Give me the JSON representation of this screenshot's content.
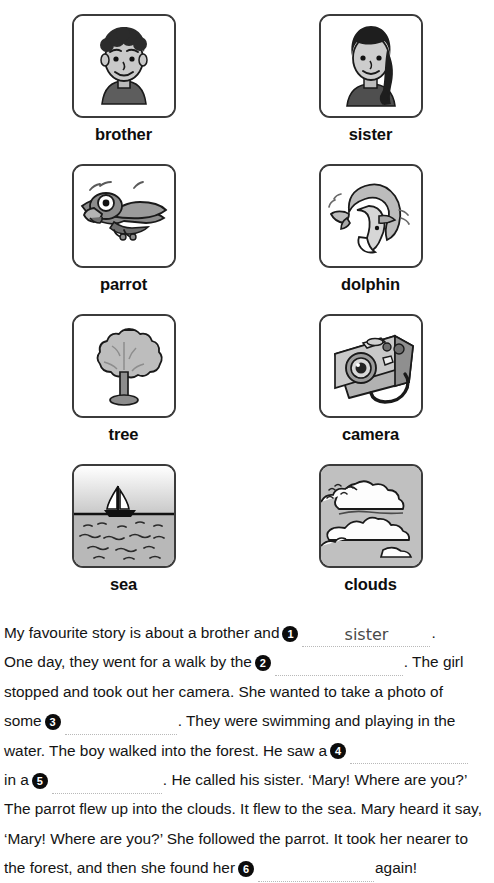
{
  "cards": [
    {
      "label": "brother",
      "icon": "brother-portrait-icon"
    },
    {
      "label": "sister",
      "icon": "sister-portrait-icon"
    },
    {
      "label": "parrot",
      "icon": "parrot-icon"
    },
    {
      "label": "dolphin",
      "icon": "dolphin-icon"
    },
    {
      "label": "tree",
      "icon": "tree-icon"
    },
    {
      "label": "camera",
      "icon": "camera-icon"
    },
    {
      "label": "sea",
      "icon": "sea-sailboat-icon"
    },
    {
      "label": "clouds",
      "icon": "clouds-icon"
    }
  ],
  "story": {
    "lines": [
      {
        "segments": [
          {
            "kind": "text",
            "value": "My favourite story is about a brother and "
          },
          {
            "kind": "marker",
            "value": "1"
          },
          {
            "kind": "blank",
            "width": 128,
            "answer": "sister"
          },
          {
            "kind": "text",
            "value": "."
          }
        ]
      },
      {
        "segments": [
          {
            "kind": "text",
            "value": "One day, they went for a walk by the "
          },
          {
            "kind": "marker",
            "value": "2"
          },
          {
            "kind": "blank",
            "width": 128,
            "answer": ""
          },
          {
            "kind": "text",
            "value": ". The girl"
          }
        ]
      },
      {
        "segments": [
          {
            "kind": "text",
            "value": "stopped and took out her camera. She wanted to take a photo of"
          }
        ]
      },
      {
        "segments": [
          {
            "kind": "text",
            "value": "some "
          },
          {
            "kind": "marker",
            "value": "3"
          },
          {
            "kind": "blank",
            "width": 112,
            "answer": ""
          },
          {
            "kind": "text",
            "value": ". They were swimming and playing in the"
          }
        ]
      },
      {
        "segments": [
          {
            "kind": "text",
            "value": "water. The boy walked into the forest. He saw a "
          },
          {
            "kind": "marker",
            "value": "4"
          },
          {
            "kind": "blank",
            "width": 118,
            "answer": ""
          }
        ]
      },
      {
        "segments": [
          {
            "kind": "text",
            "value": "in a "
          },
          {
            "kind": "marker",
            "value": "5"
          },
          {
            "kind": "blank",
            "width": 110,
            "answer": ""
          },
          {
            "kind": "text",
            "value": ". He called his sister. ‘Mary! Where are you?’"
          }
        ]
      },
      {
        "segments": [
          {
            "kind": "text",
            "value": "The parrot flew up into the clouds. It flew to the sea. Mary heard it say,"
          }
        ]
      },
      {
        "segments": [
          {
            "kind": "text",
            "value": "‘Mary! Where are you?’ She followed the parrot. It took her nearer to"
          }
        ]
      },
      {
        "segments": [
          {
            "kind": "text",
            "value": "the forest, and then she found her "
          },
          {
            "kind": "marker",
            "value": "6"
          },
          {
            "kind": "blank",
            "width": 116,
            "answer": ""
          },
          {
            "kind": "text",
            "value": " again!"
          }
        ]
      }
    ]
  },
  "colors": {
    "card_border": "#3b3b3b",
    "marker_fill": "#0b0b0b",
    "marker_text": "#ffffff",
    "dotted_line": "#b9b9b9",
    "handwriting": "#4a4a4a",
    "body_text": "#141414"
  }
}
